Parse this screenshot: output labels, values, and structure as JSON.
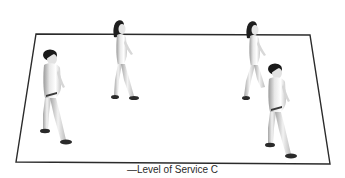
{
  "diagram": {
    "caption": "—Level of Service C",
    "platform": {
      "shape": "perspective-rectangle",
      "stroke_color": "#2b2b2b",
      "fill_color": "#ffffff"
    },
    "pedestrians": [
      {
        "id": "pedestrian-1",
        "type": "male",
        "position": "front-left"
      },
      {
        "id": "pedestrian-2",
        "type": "female",
        "position": "back-center-left"
      },
      {
        "id": "pedestrian-3",
        "type": "female",
        "position": "back-right"
      },
      {
        "id": "pedestrian-4",
        "type": "male",
        "position": "front-right"
      }
    ],
    "pedestrian_count": 4
  }
}
